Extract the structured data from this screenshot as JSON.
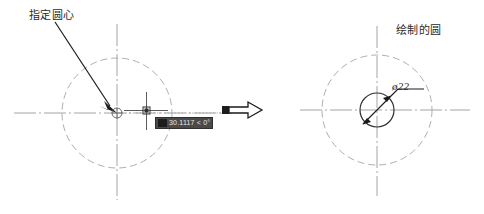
{
  "diagram": {
    "title_semantic": "autocad-circle-command-illustration",
    "colors": {
      "construction_line": "#9a9a9a",
      "object_line": "#3a3a3a",
      "centerline": "#8d8d8d",
      "annotation": "#1e1e1e",
      "tooltip_bg": "#4a4a4a",
      "tooltip_text": "#e8e8e8",
      "background": "#ffffff"
    },
    "left_panel": {
      "callout_label": "指定圆心",
      "snap_marker": "center-osnap-marker",
      "cursor": "crosshair-cursor",
      "dynamic_input": {
        "value": "30.1117 < 0°",
        "icon": "dynamic-input-icon"
      },
      "construction_circle": {
        "cx": 117,
        "cy": 113,
        "r": 55
      },
      "centerline_horizontal": {
        "x1": 14,
        "x2": 232,
        "y": 113
      },
      "centerline_vertical": {
        "y1": 24,
        "y2": 200,
        "x": 117
      }
    },
    "transition": {
      "arrow": "block-arrow-right"
    },
    "right_panel": {
      "callout_label": "绘制的圆",
      "diameter_label": "ø22",
      "construction_circle": {
        "cx": 377,
        "cy": 110,
        "r": 55
      },
      "drawn_circle": {
        "cx": 377,
        "cy": 110,
        "r": 17
      },
      "centerline_horizontal": {
        "x1": 300,
        "x2": 470,
        "y": 110
      },
      "centerline_vertical": {
        "y1": 26,
        "y2": 196,
        "x": 377
      }
    }
  }
}
